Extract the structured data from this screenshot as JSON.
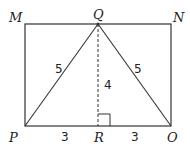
{
  "diagram": {
    "type": "geometry",
    "vertices": {
      "M": {
        "label": "M",
        "x": 25,
        "y": 24
      },
      "N": {
        "label": "N",
        "x": 171,
        "y": 24
      },
      "O": {
        "label": "O",
        "x": 171,
        "y": 126
      },
      "P": {
        "label": "P",
        "x": 25,
        "y": 126
      },
      "Q": {
        "label": "Q",
        "x": 98,
        "y": 24
      },
      "R": {
        "label": "R",
        "x": 98,
        "y": 126
      }
    },
    "measurements": {
      "PQ": "5",
      "QO": "5",
      "QR": "4",
      "PR": "3",
      "RO": "3"
    },
    "colors": {
      "stroke": "#333333",
      "text": "#222222",
      "background": "#ffffff"
    }
  }
}
